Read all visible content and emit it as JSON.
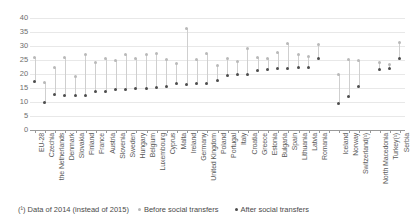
{
  "chart_data": {
    "type": "scatter",
    "title": "",
    "subtitle": "",
    "xlabel": "",
    "ylabel": "",
    "ylim": [
      0,
      40
    ],
    "yticks": [
      0,
      5,
      10,
      15,
      20,
      25,
      30,
      35,
      40
    ],
    "grid": true,
    "legend_position": "bottom",
    "categories": [
      "EU-28",
      "Czechia",
      "the Netherlands",
      "Denmark",
      "Slovakia",
      "Finland",
      "France",
      "Austria",
      "Slovenia",
      "Sweden",
      "Hungary",
      "Belgium",
      "Luxembourg",
      "Cyprus",
      "Malta",
      "Ireland",
      "Germany",
      "United Kingdom",
      "Poland",
      "Portugal",
      "Italy",
      "Croatia",
      "Greece",
      "Estonia",
      "Bulgaria",
      "Spain",
      "Lithuania",
      "Latvia",
      "Romania",
      "",
      "Iceland",
      "Norway",
      "Switzerland(¹)",
      "",
      "North Macedonia",
      "Turkey(¹)",
      "Serbia"
    ],
    "series": [
      {
        "name": "Before social transfers",
        "color": "#b9b9b9",
        "values": [
          26.0,
          16.8,
          22.3,
          25.8,
          19.2,
          26.9,
          24.1,
          25.5,
          25.0,
          26.8,
          25.6,
          26.8,
          27.2,
          25.3,
          23.8,
          36.3,
          25.1,
          27.3,
          23.1,
          25.6,
          24.6,
          29.1,
          26.0,
          25.7,
          27.8,
          31.0,
          27.0,
          26.3,
          30.6,
          null,
          20.0,
          25.1,
          24.7,
          null,
          24.0,
          23.5,
          31.2
        ]
      },
      {
        "name": "After social transfers",
        "color": "#4d4d4d",
        "values": [
          17.3,
          9.7,
          12.7,
          12.2,
          12.3,
          12.4,
          13.6,
          13.9,
          14.3,
          14.5,
          14.9,
          14.9,
          15.3,
          15.4,
          16.5,
          16.4,
          16.7,
          16.7,
          17.6,
          19.5,
          19.9,
          20.0,
          21.4,
          21.6,
          22.0,
          22.1,
          22.2,
          22.5,
          25.4,
          null,
          9.6,
          11.9,
          15.6,
          null,
          21.5,
          21.9,
          25.4
        ]
      }
    ],
    "footnote": "(¹) Data of 2014 (instead of 2015)"
  },
  "legend": {
    "items": [
      {
        "label": "Before social transfers",
        "marker": "before-dot-icon"
      },
      {
        "label": "After social transfers",
        "marker": "after-dot-icon"
      }
    ]
  }
}
